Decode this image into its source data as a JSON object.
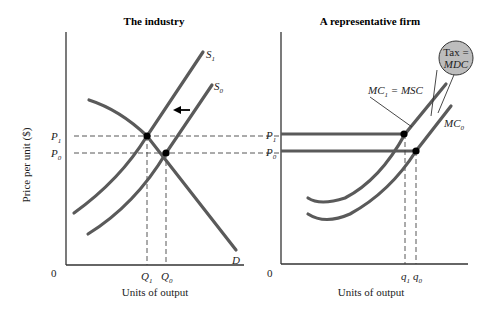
{
  "left_panel": {
    "title": "The industry",
    "y_axis_label": "Price per unit ($)",
    "x_axis_label": "Units of output",
    "origin": "0",
    "curves": {
      "supply_new": {
        "label": "S",
        "sub": "1"
      },
      "supply_old": {
        "label": "S",
        "sub": "0"
      },
      "demand": {
        "label": "D"
      }
    },
    "price_ticks": [
      {
        "label": "P",
        "sub": "1"
      },
      {
        "label": "P",
        "sub": "0"
      }
    ],
    "quantity_ticks": [
      {
        "label": "Q",
        "sub": "1"
      },
      {
        "label": "Q",
        "sub": "0"
      }
    ],
    "shift_arrow": "leftward shift of supply"
  },
  "right_panel": {
    "title": "A representative firm",
    "x_axis_label": "Units of output",
    "origin": "0",
    "curves": {
      "mc_new": {
        "label": "MC",
        "sub": "1",
        "suffix": " = MSC"
      },
      "mc_old": {
        "label": "MC",
        "sub": "0"
      }
    },
    "price_ticks": [
      {
        "label": "P",
        "sub": "1"
      },
      {
        "label": "P",
        "sub": "0"
      }
    ],
    "quantity_ticks": [
      {
        "label": "q",
        "sub": "1"
      },
      {
        "label": "q",
        "sub": "0"
      }
    ],
    "tax_bubble": {
      "line1": "Tax =",
      "line2": "MDC"
    }
  },
  "colors": {
    "curve": "#5a5a5a",
    "axis": "#333333",
    "bubble_fill": "#bdbdbd",
    "point": "#000000"
  }
}
